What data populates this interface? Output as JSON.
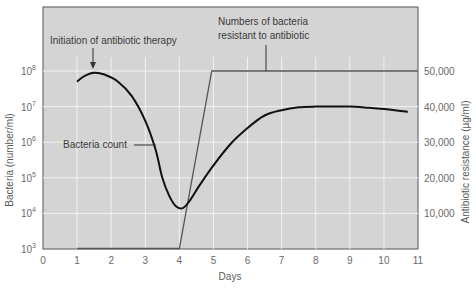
{
  "chart_data": {
    "type": "line",
    "title": "",
    "xlabel": "Days",
    "ylabel_left": "Bacteria (number/ml)",
    "ylabel_right": "Antibiotic resistance (µg/ml)",
    "xlim": [
      0,
      11
    ],
    "ylim_left_log10": [
      3,
      8.9
    ],
    "ylim_right": [
      0,
      50000
    ],
    "grid": true,
    "x_ticks": [
      "0",
      "1",
      "2",
      "3",
      "4",
      "5",
      "6",
      "7",
      "8",
      "9",
      "10",
      "11"
    ],
    "y_left_ticks": [
      {
        "exp": 3,
        "label": "10",
        "sup": "3"
      },
      {
        "exp": 4,
        "label": "10",
        "sup": "4"
      },
      {
        "exp": 5,
        "label": "10",
        "sup": "5"
      },
      {
        "exp": 6,
        "label": "10",
        "sup": "6"
      },
      {
        "exp": 7,
        "label": "10",
        "sup": "7"
      },
      {
        "exp": 8,
        "label": "10",
        "sup": "8"
      }
    ],
    "y_right_ticks": [
      {
        "value": 10000,
        "label": "10,000"
      },
      {
        "value": 20000,
        "label": "20,000"
      },
      {
        "value": 30000,
        "label": "30,000"
      },
      {
        "value": 40000,
        "label": "40,000"
      },
      {
        "value": 50000,
        "label": "50,000"
      }
    ],
    "series": [
      {
        "name": "Bacteria count",
        "axis": "left",
        "scale": "log10",
        "points": [
          [
            1.0,
            7.7
          ],
          [
            1.2,
            7.85
          ],
          [
            1.5,
            7.95
          ],
          [
            1.8,
            7.9
          ],
          [
            2.2,
            7.7
          ],
          [
            2.6,
            7.3
          ],
          [
            3.0,
            6.6
          ],
          [
            3.3,
            5.8
          ],
          [
            3.5,
            5.0
          ],
          [
            3.7,
            4.5
          ],
          [
            3.9,
            4.2
          ],
          [
            4.1,
            4.15
          ],
          [
            4.3,
            4.35
          ],
          [
            4.6,
            4.8
          ],
          [
            5.0,
            5.35
          ],
          [
            5.5,
            5.95
          ],
          [
            6.0,
            6.4
          ],
          [
            6.5,
            6.75
          ],
          [
            7.0,
            6.9
          ],
          [
            7.5,
            6.98
          ],
          [
            8.0,
            7.0
          ],
          [
            8.5,
            7.0
          ],
          [
            9.0,
            7.0
          ],
          [
            9.5,
            6.97
          ],
          [
            10.0,
            6.93
          ],
          [
            10.7,
            6.85
          ]
        ],
        "color": "#111111"
      },
      {
        "name": "Numbers of bacteria resistant to antibiotic",
        "axis": "right",
        "points": [
          [
            1.0,
            0
          ],
          [
            4.0,
            0
          ],
          [
            4.95,
            50000
          ],
          [
            11.0,
            50000
          ]
        ],
        "color": "#555555"
      }
    ],
    "annotations": [
      {
        "text": "Initiation of antibiotic therapy",
        "x": 1.5,
        "arrow_to_exp": 8.0
      },
      {
        "text": "Bacteria count",
        "x": 2.7,
        "exp": 6.0
      },
      {
        "text_lines": [
          "Numbers of bacteria",
          "resistant to antibiotic"
        ],
        "x": 5.8
      }
    ]
  },
  "labels": {
    "xlabel": "Days",
    "ylabel_left": "Bacteria (number/ml)",
    "ylabel_right": "Antibiotic resistance (µg/ml)",
    "ann_therapy": "Initiation of antibiotic therapy",
    "ann_count": "Bacteria count",
    "ann_resist_1": "Numbers of bacteria",
    "ann_resist_2": "resistant to antibiotic"
  },
  "colors": {
    "plot_bg": "#d4d4d4",
    "grid": "#f2f2f2",
    "frame": "#555555",
    "bacteria_line": "#111111",
    "resistance_line": "#555555"
  }
}
